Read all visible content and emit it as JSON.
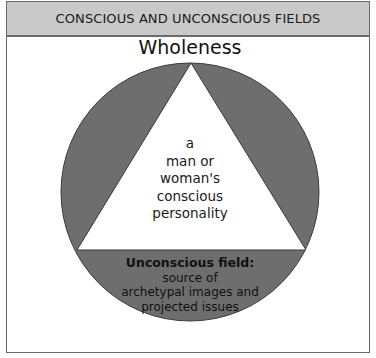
{
  "header": {
    "title": "CONSCIOUS AND UNCONSCIOUS FIELDS"
  },
  "diagram": {
    "top_label": "Wholeness",
    "triangle_label": {
      "lines": [
        "a",
        "man or",
        "woman's",
        "conscious",
        "personality"
      ]
    },
    "bottom_label": {
      "heading": "Unconscious field:",
      "lines": [
        "source of",
        "archetypal images and",
        "projected issues"
      ]
    },
    "shapes": {
      "circle": "unconscious field circle",
      "triangle": "conscious personality triangle"
    }
  },
  "colors": {
    "header_bg": "#c9c9c9",
    "border": "#6a6a6a",
    "circle_fill": "#6e6e6e",
    "triangle_fill": "#ffffff"
  }
}
